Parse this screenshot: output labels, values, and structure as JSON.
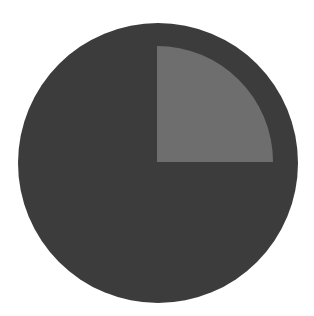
{
  "chart_data": {
    "type": "pie",
    "title": "",
    "categories": [
      "Highlighted quarter",
      "Remainder"
    ],
    "values": [
      25,
      75
    ],
    "colors": [
      "#6e6e6e",
      "#3c3c3c"
    ],
    "legend": "none",
    "labels_visible": false,
    "layout": {
      "center": [
        158,
        163
      ],
      "outer_radius": 140,
      "highlight_radius": 116,
      "highlight_start_deg": 0,
      "highlight_end_deg": 90,
      "highlight_offset": [
        -1,
        -1
      ]
    }
  },
  "background": "#ffffff"
}
